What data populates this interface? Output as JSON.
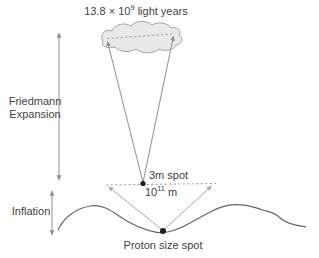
{
  "diagram": {
    "age_label": {
      "prefix": "13.8 × 10",
      "superscript": "9",
      "suffix": " light years"
    },
    "friedmann": {
      "line1": "Friedmann",
      "line2": "Expansion"
    },
    "inflation": {
      "label": "Inflation"
    },
    "spot_3m": {
      "label": "3m spot"
    },
    "distance": {
      "prefix": "10",
      "superscript": "11",
      "suffix": " m"
    },
    "proton": {
      "label": "Proton size spot"
    }
  },
  "colors": {
    "background": "#ffffff",
    "text": "#3f3f3f",
    "arrow_gray": "#8f8f8f",
    "dashed_gray": "#a8a8a8",
    "diagonal_gray": "#a8a8a8",
    "curve": "#666666",
    "cloud_fill": "#e9e9e9",
    "cloud_stroke": "#a3a3a3",
    "dot": "#1c1c1c"
  }
}
